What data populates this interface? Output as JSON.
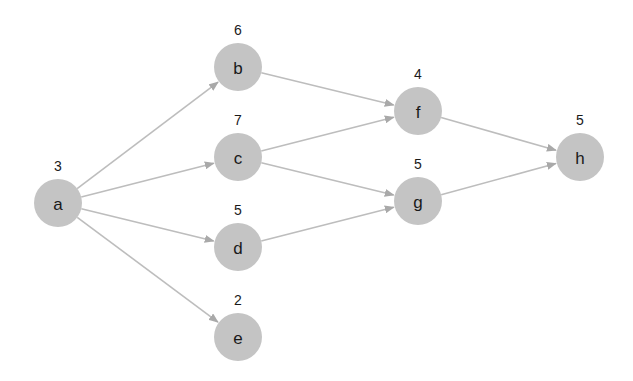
{
  "diagram": {
    "type": "directed-acyclic-graph",
    "node_radius": 24,
    "colors": {
      "node_fill": "#c4c4c4",
      "edge": "#bdbdbd",
      "arrowhead": "#a9a9a9",
      "text": "#1a1a1a",
      "background": "#ffffff"
    },
    "nodes": [
      {
        "id": "a",
        "label": "a",
        "weight": "3",
        "x": 58,
        "y": 203
      },
      {
        "id": "b",
        "label": "b",
        "weight": "6",
        "x": 238,
        "y": 67
      },
      {
        "id": "c",
        "label": "c",
        "weight": "7",
        "x": 238,
        "y": 157
      },
      {
        "id": "d",
        "label": "d",
        "weight": "5",
        "x": 238,
        "y": 247
      },
      {
        "id": "e",
        "label": "e",
        "weight": "2",
        "x": 238,
        "y": 337
      },
      {
        "id": "f",
        "label": "f",
        "weight": "4",
        "x": 418,
        "y": 111
      },
      {
        "id": "g",
        "label": "g",
        "weight": "5",
        "x": 418,
        "y": 201
      },
      {
        "id": "h",
        "label": "h",
        "weight": "5",
        "x": 580,
        "y": 157
      }
    ],
    "edges": [
      {
        "from": "a",
        "to": "b"
      },
      {
        "from": "a",
        "to": "c"
      },
      {
        "from": "a",
        "to": "d"
      },
      {
        "from": "a",
        "to": "e"
      },
      {
        "from": "b",
        "to": "f"
      },
      {
        "from": "c",
        "to": "f"
      },
      {
        "from": "c",
        "to": "g"
      },
      {
        "from": "d",
        "to": "g"
      },
      {
        "from": "f",
        "to": "h"
      },
      {
        "from": "g",
        "to": "h"
      }
    ]
  }
}
